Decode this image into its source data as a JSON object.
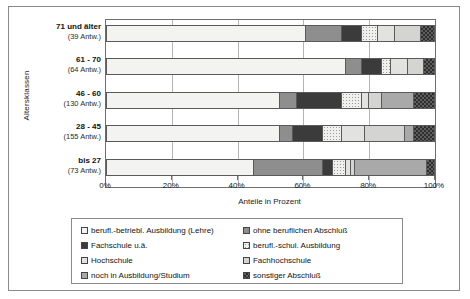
{
  "chart_data": {
    "type": "bar",
    "orientation": "horizontal",
    "stacked": true,
    "normalized": "percent",
    "title": "",
    "xlabel": "Anteile in Prozent",
    "ylabel": "Altersklassen",
    "xlim": [
      0,
      100
    ],
    "xticks": [
      0,
      20,
      40,
      60,
      80,
      100
    ],
    "xticklabels": [
      "0%",
      "20%",
      "40%",
      "60%",
      "80%",
      "100%"
    ],
    "grid": true,
    "legend_position": "bottom",
    "categories": [
      "71 und älter",
      "61 - 70",
      "46 - 60",
      "28 - 45",
      "bis 27"
    ],
    "category_sublabels": [
      "(39 Antw.)",
      "(64 Antw.)",
      "(130 Antw.)",
      "(155 Antw.)",
      "(73 Antw.)"
    ],
    "category_counts": [
      39,
      64,
      130,
      155,
      73
    ],
    "series": [
      {
        "name": "berufl.-betriebl. Ausbildung (Lehre)",
        "fill": "f0",
        "values": [
          61,
          73,
          53,
          53,
          45
        ]
      },
      {
        "name": "ohne beruflichen Abschluß",
        "fill": "f1",
        "values": [
          11,
          5,
          5,
          4,
          21
        ]
      },
      {
        "name": "Fachschule u.ä.",
        "fill": "f2",
        "values": [
          6,
          6,
          14,
          9,
          3
        ]
      },
      {
        "name": "berufl.-schul. Ausbildung",
        "fill": "f3",
        "values": [
          5,
          3,
          6,
          6,
          4
        ]
      },
      {
        "name": "Hochschule",
        "fill": "f4",
        "values": [
          5,
          5,
          2,
          7,
          1.5
        ]
      },
      {
        "name": "Fachhochschule",
        "fill": "f5",
        "values": [
          8,
          5,
          4,
          12,
          1.5
        ]
      },
      {
        "name": "noch in Ausbildung/Studium",
        "fill": "f6",
        "values": [
          0,
          0,
          10,
          3,
          22
        ]
      },
      {
        "name": "sonstiger Abschluß",
        "fill": "f7",
        "values": [
          4,
          3,
          6,
          6,
          2
        ]
      }
    ]
  },
  "legend": {
    "rows": [
      [
        {
          "label": "berufl.-betriebl. Ausbildung (Lehre)",
          "fill": "f0"
        },
        {
          "label": "ohne beruflichen Abschluß",
          "fill": "f1"
        }
      ],
      [
        {
          "label": "Fachschule u.ä.",
          "fill": "f2"
        },
        {
          "label": "berufl.-schul. Ausbildung",
          "fill": "f3"
        }
      ],
      [
        {
          "label": "Hochschule",
          "fill": "f4"
        },
        {
          "label": "Fachhochschule",
          "fill": "f5"
        }
      ],
      [
        {
          "label": "noch in Ausbildung/Studium",
          "fill": "f6"
        },
        {
          "label": "sonstiger Abschluß",
          "fill": "f7"
        }
      ]
    ]
  }
}
